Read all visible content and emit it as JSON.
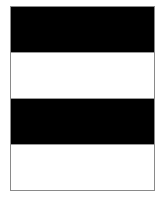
{
  "figure": {
    "frame_color": "#8a8a8a",
    "bands": [
      {
        "name": "band-1",
        "color": "#000000"
      },
      {
        "name": "band-2",
        "color": "#ffffff"
      },
      {
        "name": "band-3",
        "color": "#000000"
      },
      {
        "name": "band-4",
        "color": "#ffffff"
      }
    ]
  }
}
